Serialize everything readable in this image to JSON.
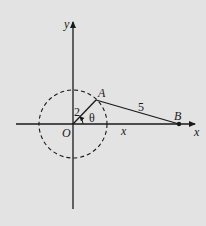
{
  "diagram": {
    "background": "#e3e3e3",
    "stroke": "#1a1a1a",
    "origin": {
      "label": "O",
      "x": 73,
      "y": 124
    },
    "axes": {
      "x_label": "x",
      "y_label": "y"
    },
    "circle": {
      "cx": 73,
      "cy": 124,
      "r": 34,
      "style": "dashed"
    },
    "points": {
      "A": {
        "label": "A",
        "x": 96,
        "y": 100
      },
      "B": {
        "label": "B",
        "x": 179,
        "y": 124
      }
    },
    "segments": {
      "OA_length": "2",
      "AB_length": "5",
      "OB_label": "x"
    },
    "angle": {
      "label": "θ"
    }
  }
}
